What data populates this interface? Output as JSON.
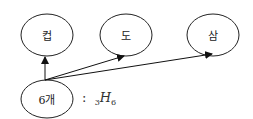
{
  "diagram": {
    "nodes": [
      {
        "id": "n1",
        "label": "컵"
      },
      {
        "id": "n2",
        "label": "도"
      },
      {
        "id": "n3",
        "label": "삼"
      },
      {
        "id": "source",
        "label": "6개"
      }
    ],
    "edges": [
      {
        "from": "source",
        "to": "n1"
      },
      {
        "from": "source",
        "to": "n2"
      },
      {
        "from": "source",
        "to": "n3"
      }
    ],
    "annotation": {
      "colon": ":",
      "pre_subscript": "3",
      "symbol": "H",
      "subscript": "6"
    }
  }
}
